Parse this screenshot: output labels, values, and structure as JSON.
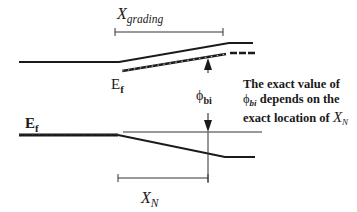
{
  "diagram": {
    "type": "band-diagram",
    "labels": {
      "x_grading": {
        "main": "X",
        "sub": "grading"
      },
      "ef_upper": {
        "main": "E",
        "sub": "f"
      },
      "ef_lower": {
        "main": "E",
        "sub": "f"
      },
      "phi_bi": {
        "main": "ϕ",
        "sub": "bi"
      },
      "x_n": {
        "main": "X",
        "sub": "N"
      }
    },
    "note": {
      "line1": "The exact value of",
      "line2_symbol": "ϕ",
      "line2_symbol_sub": "bi",
      "line2_rest": " depends on the",
      "line3_text": "exact location of ",
      "line3_symbol": "X",
      "line3_symbol_sub": "N"
    },
    "colors": {
      "line": "#1a1a1a",
      "thin_line": "#333333",
      "background": "#ffffff"
    }
  }
}
